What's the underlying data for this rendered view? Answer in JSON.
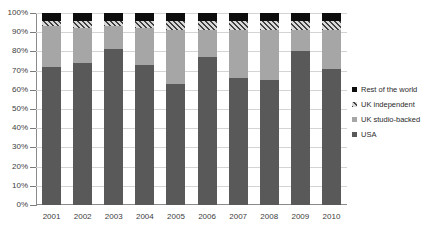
{
  "chart_data": {
    "type": "bar",
    "subtype": "stacked-100-percent",
    "title": "",
    "xlabel": "",
    "ylabel": "",
    "categories": [
      "2001",
      "2002",
      "2003",
      "2004",
      "2005",
      "2006",
      "2007",
      "2008",
      "2009",
      "2010"
    ],
    "ylim": [
      0,
      100
    ],
    "y_tick_labels": [
      "0%",
      "10%",
      "20%",
      "30%",
      "40%",
      "50%",
      "60%",
      "70%",
      "80%",
      "90%",
      "100%"
    ],
    "y_tick_values": [
      0,
      10,
      20,
      30,
      40,
      50,
      60,
      70,
      80,
      90,
      100
    ],
    "grid": true,
    "grid_axis": "y",
    "legend_position": "right",
    "series": [
      {
        "name": "USA",
        "color": "#595959",
        "pattern": "solid",
        "values": [
          72,
          74,
          81,
          73,
          63,
          77,
          66,
          65,
          80,
          71
        ]
      },
      {
        "name": "UK studio-backed",
        "color": "#a6a6a6",
        "pattern": "solid",
        "values": [
          21,
          18,
          12,
          19,
          28,
          14,
          25,
          26,
          11,
          20
        ]
      },
      {
        "name": "UK independent",
        "color": "#b0b0b0",
        "pattern": "diagonal-hatch",
        "values": [
          3,
          4,
          3,
          4,
          5,
          5,
          5,
          5,
          5,
          5
        ]
      },
      {
        "name": "Rest of the world",
        "color": "#0d0d0d",
        "pattern": "solid",
        "values": [
          4,
          4,
          4,
          4,
          4,
          4,
          4,
          4,
          4,
          4
        ]
      }
    ]
  },
  "legend": {
    "entries": [
      {
        "label": "Rest of the world",
        "swatch": "legend-swatch-rest-of-the-world"
      },
      {
        "label": "UK independent",
        "swatch": "legend-swatch-uk-independent"
      },
      {
        "label": "UK studio-backed",
        "swatch": "legend-swatch-uk-studio-backed"
      },
      {
        "label": "USA",
        "swatch": "legend-swatch-usa"
      }
    ]
  }
}
